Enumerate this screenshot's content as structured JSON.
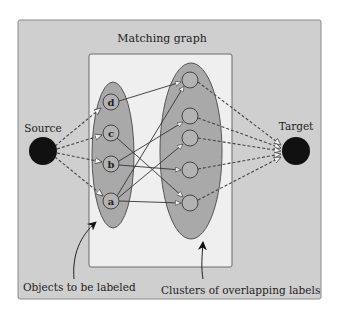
{
  "diagram": {
    "title": "Matching graph",
    "source": {
      "label": "Source"
    },
    "target": {
      "label": "Target"
    },
    "objects": [
      {
        "id": "d",
        "label": "d"
      },
      {
        "id": "c",
        "label": "c"
      },
      {
        "id": "b",
        "label": "b"
      },
      {
        "id": "a",
        "label": "a"
      }
    ],
    "label_nodes": [
      {
        "id": "n1"
      },
      {
        "id": "n2"
      },
      {
        "id": "n3"
      },
      {
        "id": "n4"
      },
      {
        "id": "n5"
      }
    ],
    "edges": [
      {
        "from": "d",
        "to": "n1"
      },
      {
        "from": "c",
        "to": "n5"
      },
      {
        "from": "b",
        "to": "n2"
      },
      {
        "from": "b",
        "to": "n4"
      },
      {
        "from": "a",
        "to": "n1"
      },
      {
        "from": "a",
        "to": "n3"
      },
      {
        "from": "a",
        "to": "n5"
      }
    ],
    "annotations": {
      "objects": "Objects to be labeled",
      "clusters": "Clusters of overlapping labels"
    },
    "colors": {
      "frame": "#cfcfcf",
      "inner": "#efefef",
      "ellipse": "#a9a9a9",
      "stroke": "#555555",
      "terminal": "#111111"
    }
  }
}
